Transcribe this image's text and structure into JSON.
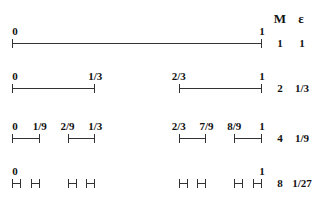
{
  "header": {
    "m_label": "M",
    "epsilon_label": "ε"
  },
  "geometry": {
    "x0": 12,
    "x1": 262
  },
  "rows": [
    {
      "y": 43,
      "M": "1",
      "epsilon": "1",
      "intervals": [
        [
          0,
          1
        ]
      ],
      "labels": [
        {
          "text": "0",
          "pos": 0
        },
        {
          "text": "1",
          "pos": 1
        }
      ]
    },
    {
      "y": 88,
      "M": "2",
      "epsilon": "1/3",
      "intervals": [
        [
          0,
          0.3333
        ],
        [
          0.6667,
          1
        ]
      ],
      "labels": [
        {
          "text": "0",
          "pos": 0
        },
        {
          "text": "1/3",
          "pos": 0.3333
        },
        {
          "text": "2/3",
          "pos": 0.6667
        },
        {
          "text": "1",
          "pos": 1
        }
      ]
    },
    {
      "y": 138,
      "M": "4",
      "epsilon": "1/9",
      "intervals": [
        [
          0,
          0.1111
        ],
        [
          0.2222,
          0.3333
        ],
        [
          0.6667,
          0.7778
        ],
        [
          0.8889,
          1
        ]
      ],
      "labels": [
        {
          "text": "0",
          "pos": 0
        },
        {
          "text": "1/9",
          "pos": 0.1111
        },
        {
          "text": "2/9",
          "pos": 0.2222
        },
        {
          "text": "1/3",
          "pos": 0.3333
        },
        {
          "text": "2/3",
          "pos": 0.6667
        },
        {
          "text": "7/9",
          "pos": 0.7778
        },
        {
          "text": "8/9",
          "pos": 0.8889
        },
        {
          "text": "1",
          "pos": 1
        }
      ]
    },
    {
      "y": 183,
      "M": "8",
      "epsilon": "1/27",
      "intervals": [
        [
          0,
          0.037
        ],
        [
          0.0741,
          0.1111
        ],
        [
          0.2222,
          0.2593
        ],
        [
          0.2963,
          0.3333
        ],
        [
          0.6667,
          0.7037
        ],
        [
          0.7407,
          0.7778
        ],
        [
          0.8889,
          0.9259
        ],
        [
          0.963,
          1
        ]
      ],
      "labels": [
        {
          "text": "0",
          "pos": 0
        },
        {
          "text": "1",
          "pos": 1
        }
      ]
    }
  ]
}
